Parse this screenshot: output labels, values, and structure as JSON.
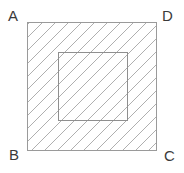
{
  "figure": {
    "type": "geometry-diagram",
    "canvas": {
      "width": 184,
      "height": 173,
      "background": "#ffffff"
    },
    "outer_square": {
      "name": "ABCD",
      "x": 27,
      "y": 22,
      "width": 130,
      "height": 129,
      "stroke": "#9a9a9a",
      "stroke_width": 1,
      "fill": "none",
      "hatch": {
        "angle_deg": 45,
        "direction": "lower-left to upper-right",
        "spacing_px": 9.2,
        "stroke": "#a6a6a6",
        "stroke_width": 0.9
      }
    },
    "inner_square": {
      "x": 58,
      "y": 52,
      "width": 70,
      "height": 69,
      "stroke": "#8f8f8f",
      "stroke_width": 1,
      "fill": "none"
    },
    "labels": [
      {
        "id": "A",
        "text": "A",
        "corner": "top-left",
        "x": 8,
        "y": 8
      },
      {
        "id": "D",
        "text": "D",
        "corner": "top-right",
        "x": 162,
        "y": 8
      },
      {
        "id": "B",
        "text": "B",
        "corner": "bottom-left",
        "x": 9,
        "y": 147
      },
      {
        "id": "C",
        "text": "C",
        "corner": "bottom-right",
        "x": 164,
        "y": 148
      }
    ],
    "label_color": "#3a3a3a"
  }
}
